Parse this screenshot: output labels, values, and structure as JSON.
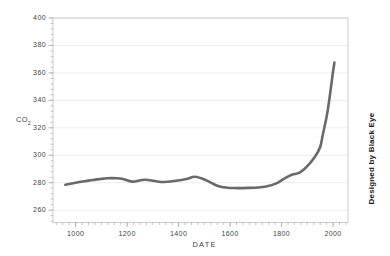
{
  "chart_data": {
    "type": "line",
    "title": "",
    "xlabel": "DATE",
    "ylabel_main": "CO",
    "ylabel_sub": "2",
    "credit": "Designed by Black Eye",
    "x_ticks": [
      1000,
      1200,
      1400,
      1600,
      1800,
      2000
    ],
    "y_ticks": [
      260,
      280,
      300,
      320,
      340,
      360,
      380,
      400
    ],
    "x_minor_step": 25,
    "y_minor_step": 4,
    "xlim": [
      912,
      2058
    ],
    "ylim": [
      251,
      400
    ],
    "grid": "horizontal-major",
    "legend": "none",
    "colors": {
      "line": "#696969",
      "frame": "#cccccc",
      "tick": "#b5b5b5",
      "grid": "#ededed",
      "label": "#3f3f3f"
    },
    "series": [
      {
        "name": "CO2 concentration",
        "points": [
          [
            960,
            278.5
          ],
          [
            1000,
            280.0
          ],
          [
            1050,
            281.5
          ],
          [
            1100,
            282.8
          ],
          [
            1140,
            283.4
          ],
          [
            1180,
            282.9
          ],
          [
            1220,
            280.8
          ],
          [
            1270,
            282.2
          ],
          [
            1330,
            280.5
          ],
          [
            1390,
            281.4
          ],
          [
            1430,
            282.6
          ],
          [
            1465,
            284.4
          ],
          [
            1510,
            281.5
          ],
          [
            1550,
            277.8
          ],
          [
            1590,
            276.3
          ],
          [
            1630,
            276.1
          ],
          [
            1670,
            276.2
          ],
          [
            1710,
            276.5
          ],
          [
            1740,
            277.2
          ],
          [
            1780,
            279.5
          ],
          [
            1810,
            283.0
          ],
          [
            1840,
            285.8
          ],
          [
            1870,
            287.3
          ],
          [
            1900,
            292.0
          ],
          [
            1930,
            299.0
          ],
          [
            1950,
            306.0
          ],
          [
            1960,
            315.0
          ],
          [
            1975,
            328.0
          ],
          [
            1985,
            340.0
          ],
          [
            1995,
            354.0
          ],
          [
            2005,
            367.5
          ]
        ]
      }
    ]
  }
}
